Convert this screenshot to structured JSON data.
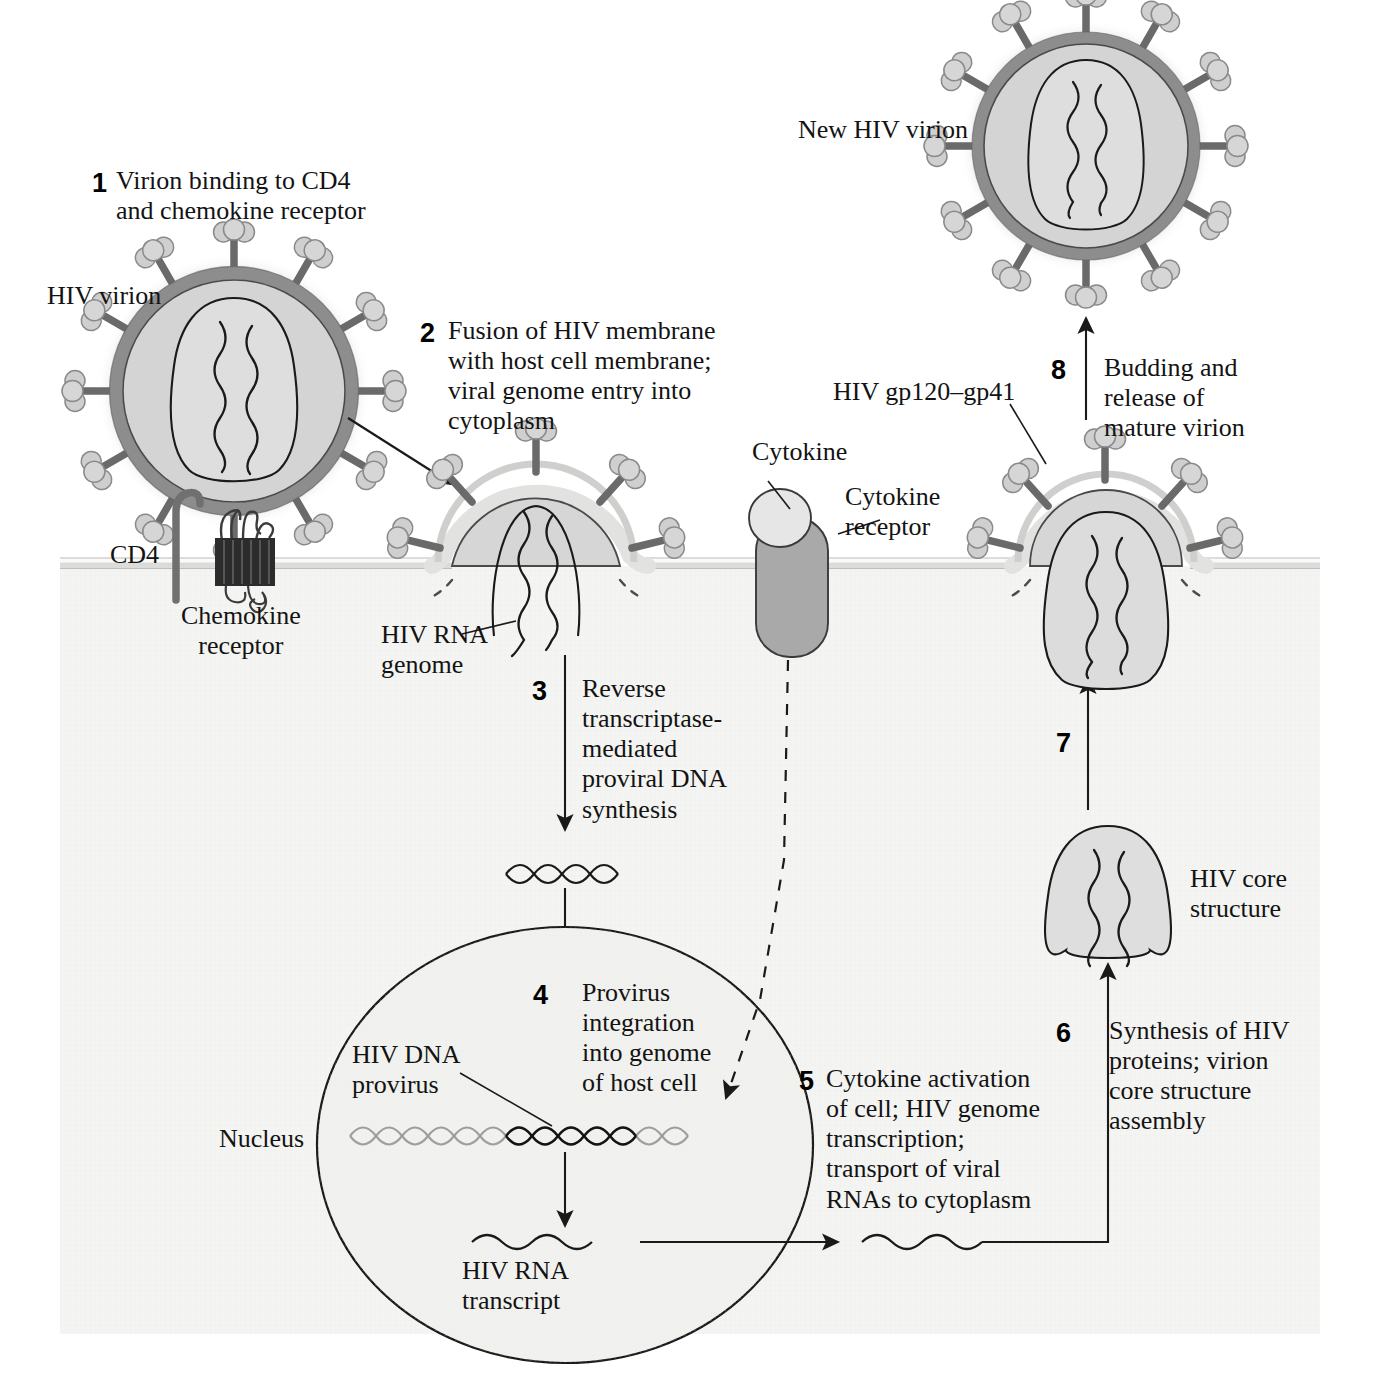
{
  "diagram": {
    "colors": {
      "cytoplasm": "#f4f4f2",
      "envelope_outer_ring": "#8f8f8f",
      "envelope_inner": "#d2d2d2",
      "core_fill": "#d9d9d9",
      "spike_head": "#cfcfcf",
      "spike_stalk": "#6a6a6a",
      "membrane": "#d8d8d6",
      "nucleus_fill": "#f0f0ee",
      "dna_host": "#9a9a9a",
      "dna_provirus": "#1a1a1a",
      "chemokine_receptor": "#2b2b2b",
      "cytokine_receptor": "#a8a8a8",
      "cytokine": "#e0e0e0",
      "stroke": "#1a1a1a"
    },
    "steps": [
      {
        "number": "1",
        "text": "Virion binding to CD4\nand chemokine receptor"
      },
      {
        "number": "2",
        "text": "Fusion of HIV membrane\nwith host cell membrane;\nviral genome entry into\ncytoplasm"
      },
      {
        "number": "3",
        "text": "Reverse\ntranscriptase-\nmediated\nproviral DNA\nsynthesis"
      },
      {
        "number": "4",
        "text": "Provirus\nintegration\ninto genome\nof host cell"
      },
      {
        "number": "5",
        "text": "Cytokine activation\nof cell; HIV genome\ntranscription;\ntransport of viral\nRNAs to cytoplasm"
      },
      {
        "number": "6",
        "text": "Synthesis of HIV\nproteins; virion\ncore structure\nassembly"
      },
      {
        "number": "7",
        "text": ""
      },
      {
        "number": "8",
        "text": "Budding and\nrelease of\nmature virion"
      }
    ],
    "labels": {
      "hiv_virion": "HIV virion",
      "cd4": "CD4",
      "chemokine_receptor": "Chemokine\nreceptor",
      "hiv_rna_genome": "HIV RNA\ngenome",
      "cytokine": "Cytokine",
      "cytokine_receptor": "Cytokine\nreceptor",
      "new_hiv_virion": "New HIV virion",
      "hiv_gp120_gp41": "HIV gp120–gp41",
      "hiv_core_structure": "HIV core\nstructure",
      "hiv_dna_provirus": "HIV DNA\nprovirus",
      "nucleus": "Nucleus",
      "hiv_rna_transcript": "HIV RNA\ntranscript"
    }
  }
}
